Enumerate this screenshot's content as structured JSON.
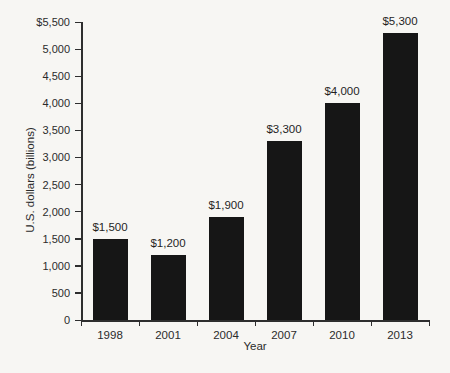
{
  "chart_data": {
    "type": "bar",
    "title": "",
    "categories": [
      "1998",
      "2001",
      "2004",
      "2007",
      "2010",
      "2013"
    ],
    "values": [
      1500,
      1200,
      1900,
      3300,
      4000,
      5300
    ],
    "value_labels": [
      "$1,500",
      "$1,200",
      "$1,900",
      "$3,300",
      "$4,000",
      "$5,300"
    ],
    "xlabel": "Year",
    "ylabel": "U.S. dollars (billions)",
    "ylim": [
      0,
      5500
    ],
    "ytick_step": 500,
    "ytick_labels": [
      "0",
      "500",
      "1,000",
      "1,500",
      "2,000",
      "2,500",
      "3,000",
      "3,500",
      "4,000",
      "4,500",
      "5,000",
      "$5,500"
    ],
    "grid": false,
    "legend_position": "none",
    "bar_color": "#161616",
    "axis_color": "#2e2e2e",
    "text_color": "#2b2b2b",
    "background_color": "#f7f6f3"
  }
}
